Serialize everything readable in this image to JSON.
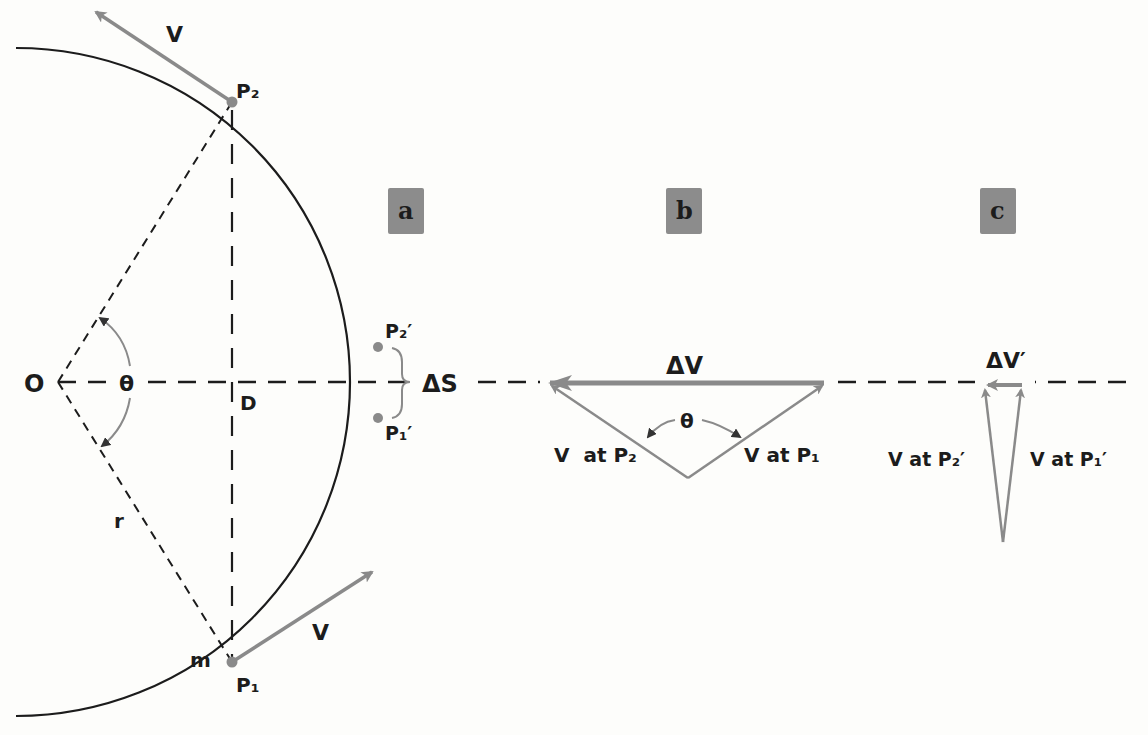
{
  "panels": {
    "a": "a",
    "b": "b",
    "c": "c"
  },
  "colors": {
    "ink": "#1c1c1c",
    "vector": "#8a8a8a",
    "panel_box": "#8c8c8c",
    "point": "#8a8a8a",
    "background": "#fdfdfb"
  },
  "circle_diagram": {
    "center_label": "O",
    "angle_label": "θ",
    "chord_label": "D",
    "radius_label": "r",
    "mass_label": "m",
    "point_p2": "P₂",
    "point_p1": "P₁",
    "point_p2_prime": "P₂′",
    "point_p1_prime": "P₁′",
    "arc_label": "ΔS",
    "velocity_top": "V",
    "velocity_bottom": "V"
  },
  "triangle_b": {
    "delta_v": "ΔV",
    "angle": "θ",
    "left_vector": "V  at P₂",
    "right_vector": "V at P₁"
  },
  "triangle_c": {
    "delta_v": "ΔV′",
    "left_vector": "V at P₂′",
    "right_vector": "V at P₁′"
  }
}
